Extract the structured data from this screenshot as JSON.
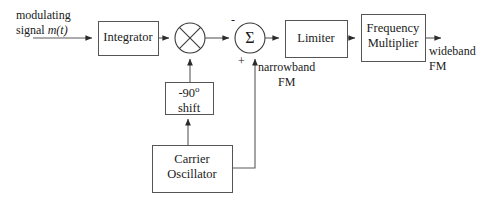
{
  "diagram": {
    "type": "block-diagram",
    "background_color": "#ffffff",
    "stroke_color": "#3a3a3a",
    "text_color": "#1a1a1a",
    "blocks": [
      {
        "id": "integrator",
        "label": "Integrator",
        "x": 98,
        "y": 21,
        "w": 60,
        "h": 34
      },
      {
        "id": "limiter",
        "label": "Limiter",
        "x": 285,
        "y": 20,
        "w": 62,
        "h": 37
      },
      {
        "id": "frequency-multiplier",
        "label_line1": "Frequency",
        "label_line2": "Multiplier",
        "x": 361,
        "y": 14,
        "w": 64,
        "h": 47
      },
      {
        "id": "phase-shift",
        "label_line1": "-90",
        "label_degree": "o",
        "label_line2": "shift",
        "x": 165,
        "y": 82,
        "w": 48,
        "h": 32
      },
      {
        "id": "carrier-oscillator",
        "label_line1": "Carrier",
        "label_line2": "Oscillator",
        "x": 152,
        "y": 145,
        "w": 80,
        "h": 47
      }
    ],
    "nodes": [
      {
        "id": "multiplier",
        "symbol": "x-cross",
        "cx": 190,
        "cy": 38,
        "r": 15
      },
      {
        "id": "summer",
        "symbol": "sigma",
        "glyph": "Σ",
        "cx": 250,
        "cy": 38,
        "r": 15
      }
    ],
    "signs": [
      {
        "id": "summer-minus",
        "text": "-",
        "x": 231,
        "y": 20
      },
      {
        "id": "summer-plus",
        "text": "+",
        "x": 238,
        "y": 58
      }
    ],
    "labels": [
      {
        "id": "input-signal",
        "line1": "modulating",
        "line2_plain": "signal ",
        "line2_italic": "m(t)",
        "x": 16,
        "y": 8
      },
      {
        "id": "narrowband-fm",
        "line1": "narrowband",
        "line2": "FM",
        "x": 258,
        "y": 60
      },
      {
        "id": "wideband-fm",
        "line1": "wideband",
        "line2": "FM",
        "x": 429,
        "y": 44
      }
    ]
  }
}
